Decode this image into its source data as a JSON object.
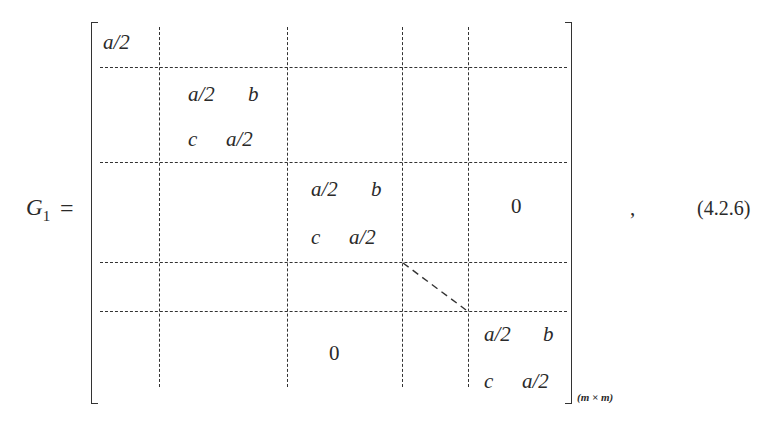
{
  "equation": {
    "lhs_symbol": "G",
    "lhs_subscript": "1",
    "equals": "=",
    "trailing_comma": ",",
    "number": "(4.2.6)",
    "dimension_subscript": "(m × m)"
  },
  "matrix": {
    "top_left_entry": "a/2",
    "blocks": [
      {
        "r1c1": "a/2",
        "r1c2": "b",
        "r2c1": "c",
        "r2c2": "a/2"
      },
      {
        "r1c1": "a/2",
        "r1c2": "b",
        "r2c1": "c",
        "r2c2": "a/2"
      },
      {
        "r1c1": "a/2",
        "r1c2": "b",
        "r2c1": "c",
        "r2c2": "a/2"
      }
    ],
    "upper_zero": "0",
    "lower_zero": "0"
  }
}
